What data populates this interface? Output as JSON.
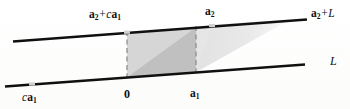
{
  "figure": {
    "background_color": "#fdfdfc",
    "line_color": "#101010",
    "dash_color": "#8a8a8a",
    "marker_color": "#c9c9c9",
    "fill_dark": "#bfbfbf",
    "fill_mid": "#d2d2d2",
    "fill_light": "#e6e6e6"
  },
  "labels": {
    "top_left": {
      "vector": "a",
      "subscript": "2",
      "operator": "+",
      "scalar": "c",
      "vector2": "a",
      "subscript2": "1"
    },
    "top_mid": {
      "vector": "a",
      "subscript": "2"
    },
    "top_right": {
      "vector": "a",
      "subscript": "2",
      "operator": "+",
      "line": "L"
    },
    "bottom_right": {
      "line": "L"
    },
    "bottom_left": {
      "scalar": "c",
      "vector": "a",
      "subscript": "1"
    },
    "origin": {
      "text": "0"
    },
    "bottom_mid": {
      "vector": "a",
      "subscript": "1"
    }
  },
  "geometry": {
    "upper_line": {
      "x1": 13,
      "y1": 41,
      "x2": 307,
      "y2": 19
    },
    "lower_line": {
      "x1": 5,
      "y1": 86,
      "x2": 305,
      "y2": 64
    },
    "parallelogram": {
      "left_x": 127,
      "right_x": 196,
      "top_left_y": 32,
      "top_right_y": 27,
      "bottom_left_y": 77,
      "bottom_right_y": 72
    },
    "markers": [
      {
        "name": "marker-ca1",
        "x": 32,
        "y": 84
      },
      {
        "name": "marker-a2ca1",
        "x": 127,
        "y": 32
      },
      {
        "name": "marker-a2",
        "x": 212,
        "y": 25
      }
    ],
    "wedge": {
      "apex_x": 291,
      "start_x": 196
    }
  }
}
